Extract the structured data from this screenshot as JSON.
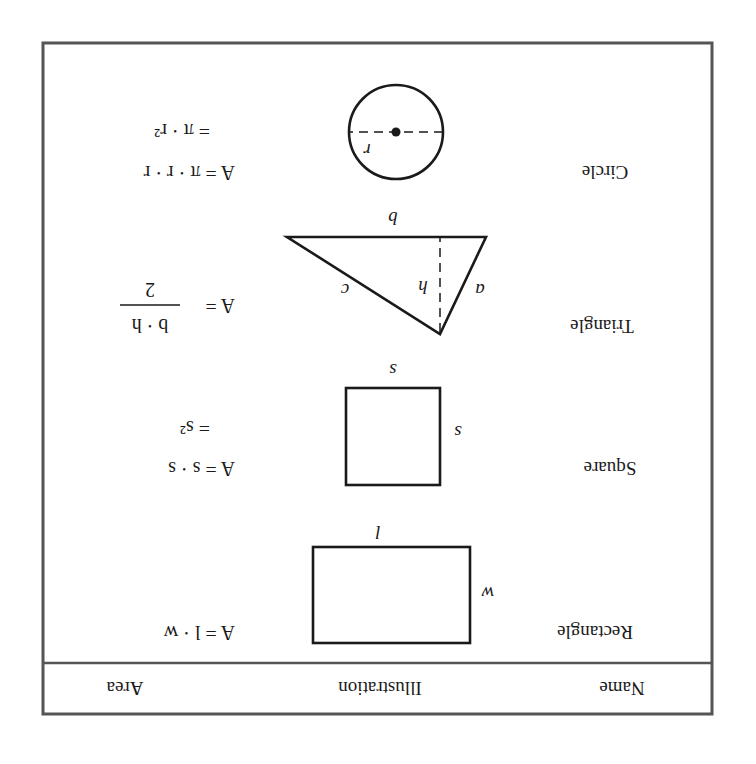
{
  "table": {
    "headers": {
      "name": "Name",
      "illustration": "Illustration",
      "area": "Area"
    },
    "rows": [
      {
        "name": "Rectangle",
        "shape": "rectangle",
        "labels": {
          "top": "l",
          "side": "w"
        },
        "formula": {
          "line1": "A = l · w"
        }
      },
      {
        "name": "Square",
        "shape": "square",
        "labels": {
          "top": "s",
          "side": "s"
        },
        "formula": {
          "line1": "A = s · s",
          "line2": "= s²"
        }
      },
      {
        "name": "Triangle",
        "shape": "triangle",
        "labels": {
          "base": "b",
          "left": "a",
          "right": "c",
          "height": "h"
        },
        "formula": {
          "prefix": "A =",
          "numerator": "b · h",
          "denominator": "2"
        }
      },
      {
        "name": "Circle",
        "shape": "circle",
        "labels": {
          "radius": "r"
        },
        "formula": {
          "line1": "A = π · r · r",
          "line2": "= π · r²"
        }
      }
    ]
  },
  "orientation": "rotated-180"
}
